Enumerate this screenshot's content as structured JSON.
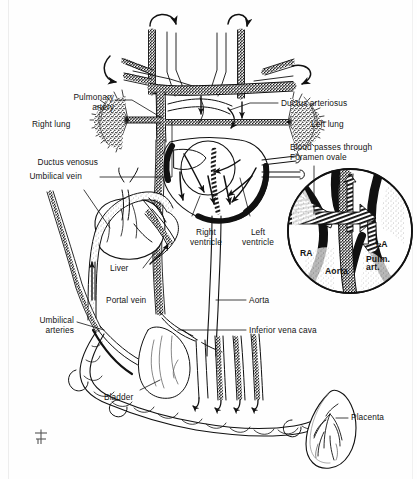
{
  "figure": {
    "type": "anatomical-diagram",
    "background_color": "#ffffff",
    "ink_color": "#141414",
    "width": 417,
    "height": 479
  },
  "labels": {
    "pulmonary_artery": "Pulmonary\nartery",
    "right_lung": "Right lung",
    "ductus_arteriosus": "Ductus arteriosus",
    "left_lung": "Left lung",
    "blood_passes_foramen_ovale": "Blood passes through\nForamen ovale",
    "ductus_venosus": "Ductus venosus",
    "umbilical_vein": "Umbilical vein",
    "right_ventricle": "Right\nventricle",
    "left_ventricle": "Left\nventricle",
    "liver": "Liver",
    "portal_vein": "Portal vein",
    "aorta": "Aorta",
    "inferior_vena_cava": "Inferior vena cava",
    "umbilical_arteries": "Umbilical\narteries",
    "bladder": "Bladder",
    "placenta": "Placenta"
  },
  "inset": {
    "name": "foramen-ovale-detail",
    "shape": "circle",
    "labels": {
      "ra": "RA",
      "la": "LA",
      "aorta": "Aorta",
      "pulm_art": "Pulm.\nart."
    }
  },
  "signature": {
    "mark": "artist-monogram"
  }
}
